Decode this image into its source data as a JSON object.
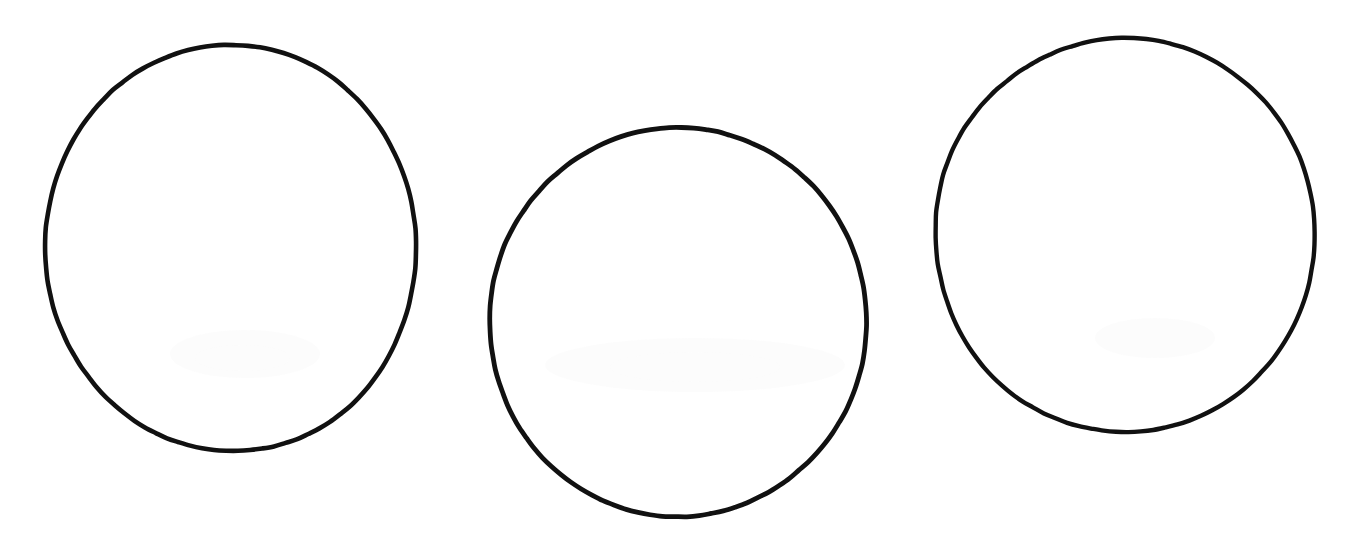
{
  "document": {
    "title": "Three Hand-Drawn Circles",
    "medium": "scanned paper drawing",
    "background_color": "#ffffff",
    "ink_color": "#111111",
    "width": 1348,
    "height": 553,
    "shape_count": 3,
    "shape_count_label": "3"
  },
  "shapes": [
    {
      "name": "circle-left",
      "label": "Circle 1",
      "order_label": "1",
      "center_x": 231,
      "center_y": 248,
      "radius_x": 185,
      "radius_y": 204,
      "stroke_width": 4.6,
      "stroke_color": "#111111",
      "fill": "none",
      "rotation": -2,
      "bounds": {
        "left": 46,
        "top": 44,
        "right": 416,
        "bottom": 452
      }
    },
    {
      "name": "circle-middle",
      "label": "Circle 2",
      "order_label": "2",
      "center_x": 678,
      "center_y": 322,
      "radius_x": 188,
      "radius_y": 195,
      "stroke_width": 4.8,
      "stroke_color": "#111111",
      "fill": "none",
      "rotation": 1,
      "bounds": {
        "left": 490,
        "top": 127,
        "right": 866,
        "bottom": 517
      }
    },
    {
      "name": "circle-right",
      "label": "Circle 3",
      "order_label": "3",
      "center_x": 1125,
      "center_y": 235,
      "radius_x": 190,
      "radius_y": 197,
      "stroke_width": 4.4,
      "stroke_color": "#111111",
      "fill": "none",
      "rotation": -1,
      "bounds": {
        "left": 935,
        "top": 38,
        "right": 1315,
        "bottom": 432
      }
    }
  ],
  "ghost_marks": [
    {
      "name": "ghost-mark-left-a",
      "x": 170,
      "y": 330,
      "width": 150,
      "height": 48
    },
    {
      "name": "ghost-mark-left-b",
      "x": 195,
      "y": 345,
      "width": 95,
      "height": 26
    },
    {
      "name": "ghost-mark-middle-a",
      "x": 545,
      "y": 338,
      "width": 300,
      "height": 54
    },
    {
      "name": "ghost-mark-middle-b",
      "x": 610,
      "y": 352,
      "width": 170,
      "height": 30
    },
    {
      "name": "ghost-mark-right-a",
      "x": 1095,
      "y": 318,
      "width": 120,
      "height": 40
    }
  ]
}
